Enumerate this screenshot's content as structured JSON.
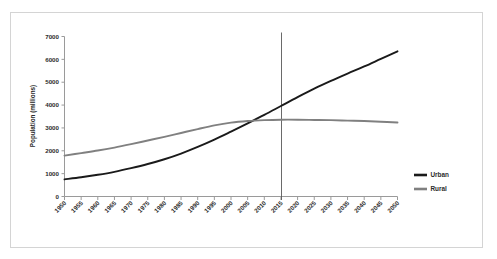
{
  "chart_data": {
    "type": "line",
    "title": "",
    "xlabel": "",
    "ylabel": "Population (millions)",
    "xlim": [
      1950,
      2050
    ],
    "ylim": [
      0,
      7000
    ],
    "ytick_step": 1000,
    "xtick_step": 5,
    "grid": false,
    "legend_position": "right",
    "categories": [
      "1950",
      "1955",
      "1960",
      "1965",
      "1970",
      "1975",
      "1980",
      "1985",
      "1990",
      "1995",
      "2000",
      "2005",
      "2010",
      "2015",
      "2020",
      "2025",
      "2030",
      "2035",
      "2040",
      "2045",
      "2050"
    ],
    "ytick_labels": [
      "0",
      "1000",
      "2000",
      "3000",
      "4000",
      "5000",
      "6000",
      "7000"
    ],
    "series": [
      {
        "name": "Urban",
        "color": "#1a1a1a",
        "values": [
          750,
          840,
          950,
          1080,
          1240,
          1420,
          1630,
          1880,
          2170,
          2490,
          2840,
          3200,
          3570,
          3960,
          4350,
          4720,
          5060,
          5380,
          5690,
          6020,
          6350
        ]
      },
      {
        "name": "Rural",
        "color": "#808080",
        "values": [
          1790,
          1900,
          2010,
          2140,
          2290,
          2450,
          2610,
          2780,
          2950,
          3110,
          3230,
          3300,
          3340,
          3360,
          3360,
          3350,
          3340,
          3320,
          3300,
          3270,
          3240
        ]
      }
    ],
    "annotations": [
      {
        "name": "reference-line-2015",
        "type": "vline",
        "x": 2015,
        "color": "#595959"
      }
    ]
  },
  "legend": {
    "items": [
      {
        "label": "Urban",
        "color": "#1a1a1a"
      },
      {
        "label": "Rural",
        "color": "#808080"
      }
    ]
  }
}
